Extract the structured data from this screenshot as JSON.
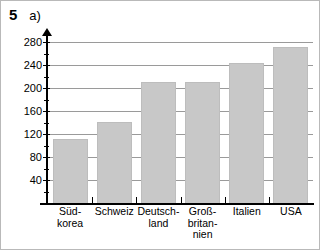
{
  "header": {
    "exercise_number": "5",
    "part_label": "a)"
  },
  "chart_data": {
    "type": "bar",
    "title": "",
    "subtitle": "",
    "xlabel": "",
    "ylabel": "",
    "categories": [
      "Süd-\nkorea",
      "Schweiz",
      "Deutsch-\nland",
      "Groß-\nbritan-\nnien",
      "Italien",
      "USA"
    ],
    "categories_plain": [
      "Südkorea",
      "Schweiz",
      "Deutschland",
      "Großbritannien",
      "Italien",
      "USA"
    ],
    "values": [
      111,
      141,
      210,
      210,
      243,
      272
    ],
    "ylim": [
      0,
      290
    ],
    "ytick_labels": [
      "40",
      "80",
      "120",
      "160",
      "200",
      "240",
      "280"
    ],
    "ytick_values": [
      40,
      80,
      120,
      160,
      200,
      240,
      280
    ],
    "minor_tick_values": [
      20,
      60,
      100,
      140,
      180,
      220,
      260
    ],
    "grid": true,
    "grid_axis": "y",
    "legend": "none",
    "bar_color": "#c8c8c8",
    "grid_color": "#9a9a9a",
    "axis_color": "#000000",
    "frame_color": "#b9b9b9"
  }
}
